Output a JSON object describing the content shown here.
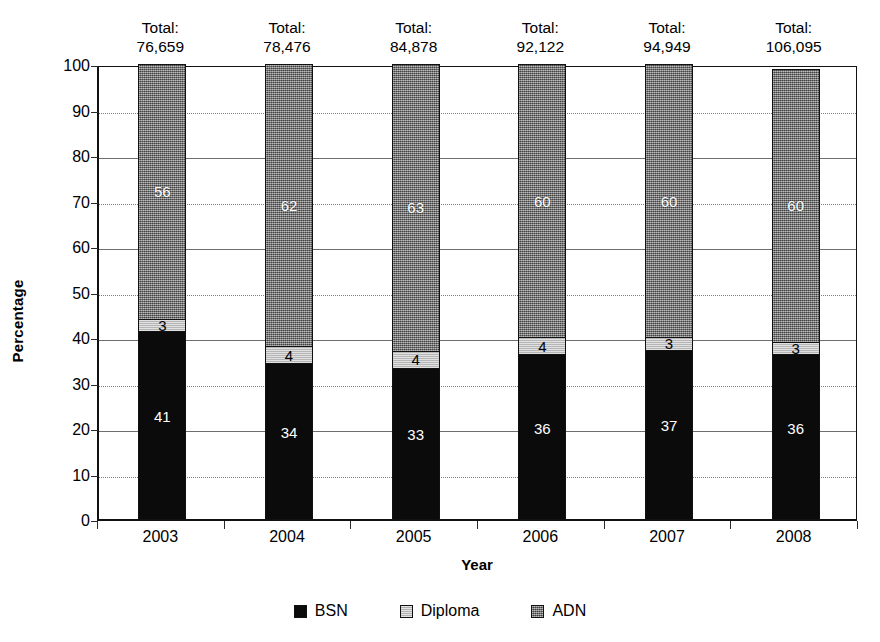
{
  "chart_data": {
    "type": "bar",
    "stacked": true,
    "title": "",
    "xlabel": "Year",
    "ylabel": "Percentage",
    "ylim": [
      0,
      100
    ],
    "ytick_labels": [
      "0",
      "10",
      "20",
      "30",
      "40",
      "50",
      "60",
      "70",
      "80",
      "90",
      "100"
    ],
    "ytick_values": [
      0,
      10,
      20,
      30,
      40,
      50,
      60,
      70,
      80,
      90,
      100
    ],
    "grid": true,
    "grid_axis": "y",
    "legend_position": "bottom",
    "categories": [
      "2003",
      "2004",
      "2005",
      "2006",
      "2007",
      "2008"
    ],
    "series": [
      {
        "name": "BSN",
        "color": "#0b0b0b",
        "values": [
          41,
          34,
          33,
          36,
          37,
          36
        ]
      },
      {
        "name": "Diploma",
        "color": "#c9c9c9",
        "values": [
          3,
          4,
          4,
          4,
          3,
          3
        ]
      },
      {
        "name": "ADN",
        "color": "#7a7a7a",
        "values": [
          56,
          62,
          63,
          60,
          60,
          60
        ]
      }
    ],
    "stack_order": [
      "BSN",
      "Diploma",
      "ADN"
    ],
    "annotations": [
      {
        "label": "Total:",
        "value": "76,659",
        "category": "2003"
      },
      {
        "label": "Total:",
        "value": "78,476",
        "category": "2004"
      },
      {
        "label": "Total:",
        "value": "84,878",
        "category": "2005"
      },
      {
        "label": "Total:",
        "value": "92,122",
        "category": "2006"
      },
      {
        "label": "Total:",
        "value": "94,949",
        "category": "2007"
      },
      {
        "label": "Total:",
        "value": "106,095",
        "category": "2008"
      }
    ]
  },
  "legend": {
    "items": [
      {
        "label": "BSN",
        "swatch": "bsn"
      },
      {
        "label": "Diploma",
        "swatch": "diploma"
      },
      {
        "label": "ADN",
        "swatch": "adn"
      }
    ]
  }
}
